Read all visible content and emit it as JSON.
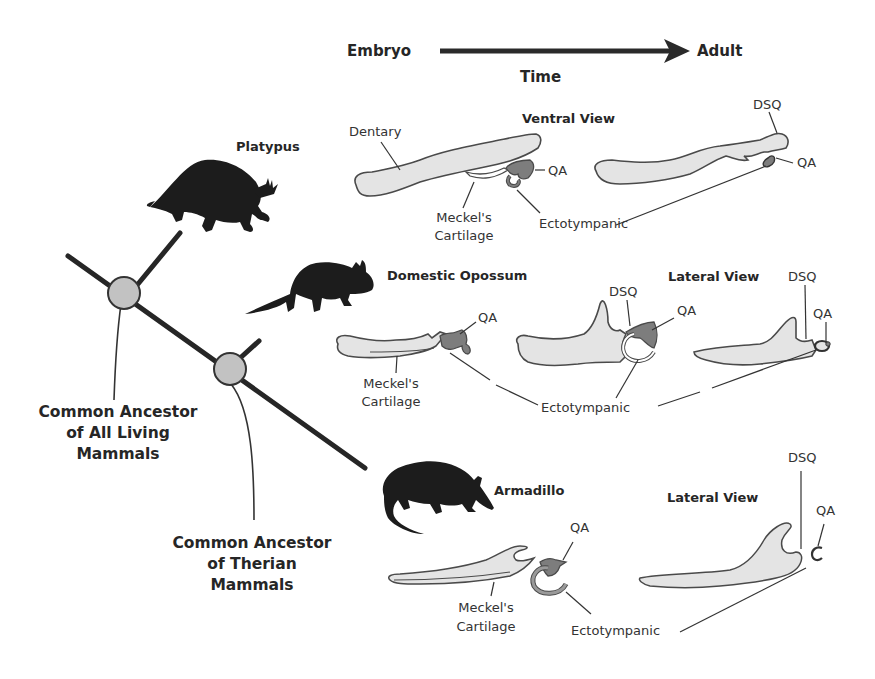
{
  "figure": {
    "timeline": {
      "start_label": "Embryo",
      "end_label": "Adult",
      "axis_label": "Time"
    },
    "phylogeny": {
      "nodes": [
        {
          "id": "mammalia",
          "label_lines": [
            "Common Ancestor",
            "of All Living",
            "Mammals"
          ]
        },
        {
          "id": "theria",
          "label_lines": [
            "Common Ancestor",
            "of Therian",
            "Mammals"
          ]
        }
      ],
      "taxa": [
        {
          "id": "platypus",
          "name": "Platypus"
        },
        {
          "id": "opossum",
          "name": "Domestic Opossum"
        },
        {
          "id": "armadillo",
          "name": "Armadillo"
        }
      ]
    },
    "views": {
      "ventral": "Ventral View",
      "lateral_opossum": "Lateral View",
      "lateral_armadillo": "Lateral View"
    },
    "labels": {
      "dentary": "Dentary",
      "meckels_line1": "Meckel's",
      "meckels_line2": "Cartilage",
      "qa": "QA",
      "dsq": "DSQ",
      "ectotympanic": "Ectotympanic"
    },
    "colors": {
      "bone_fill": "#e4e4e4",
      "qa_fill": "#7d7d7d",
      "outline": "#4a4a4a",
      "silhouette": "#1c1c1c",
      "node_fill": "#c2c2c2",
      "branch": "#262626"
    }
  }
}
